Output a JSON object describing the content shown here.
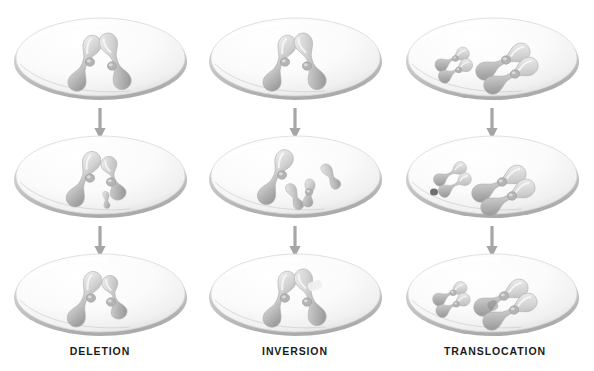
{
  "figure": {
    "background_color": "#ffffff",
    "width": 594,
    "height": 371,
    "rows": 3,
    "columns": 3
  },
  "palette": {
    "cell_fill_light": "#fdfdfd",
    "cell_fill_mid": "#f2f2f2",
    "cell_rim_shadow": "#b9b9b9",
    "cell_outline": "#cfcfcf",
    "chromosome_light": "#e9e9e9",
    "chromosome_mid": "#c9c9c9",
    "chromosome_dark": "#9a9a9a",
    "centromere": "#a8a8a8",
    "fragment_dark": "#6f6f6f",
    "arrow": "#a6a6a6",
    "caption_text": "#1b1b1b"
  },
  "columns": [
    {
      "id": "deletion",
      "caption": "DELETION",
      "center_x": 100,
      "stages": [
        {
          "row": 1,
          "name": "intact-chromosome",
          "description": "Normal duplicated chromosome with two sister chromatids crossed in an X shape inside the cell"
        },
        {
          "row": 2,
          "name": "fragment-broken-off",
          "description": "A small terminal segment has broken away from one chromatid and lies free below the centromere"
        },
        {
          "row": 3,
          "name": "shortened-chromosome",
          "description": "Chromosome reseals without the lost fragment, resulting in a shortened arm"
        }
      ]
    },
    {
      "id": "inversion",
      "caption": "INVERSION",
      "center_x": 295,
      "stages": [
        {
          "row": 1,
          "name": "intact-chromosome",
          "description": "Normal duplicated chromosome with two sister chromatids crossed in an X shape inside the cell"
        },
        {
          "row": 2,
          "name": "segment-detached",
          "description": "One chromatid breaks in two places releasing an interior segment that will be flipped"
        },
        {
          "row": 3,
          "name": "segment-reinserted-reversed",
          "description": "The segment is reinserted in reverse orientation, restoring length with inverted gene order"
        }
      ]
    },
    {
      "id": "translocation",
      "caption": "TRANSLOCATION",
      "center_x": 492,
      "stages": [
        {
          "row": 1,
          "name": "two-chromosome-pairs",
          "description": "Two different chromosomes in one cell: a smaller pair at upper left and a larger X-shaped pair at right"
        },
        {
          "row": 2,
          "name": "segments-exchanged",
          "description": "Both chromosomes break; detached pieces including a small dark fragment lie free in the cell"
        },
        {
          "row": 3,
          "name": "recombined-chromosomes",
          "description": "Each chromosome reforms carrying a segment from the other chromosome"
        }
      ]
    }
  ],
  "arrows": [
    {
      "name": "arrow-deletion-1-to-2",
      "column": "deletion",
      "from_row": 1,
      "to_row": 2,
      "direction": "down"
    },
    {
      "name": "arrow-deletion-2-to-3",
      "column": "deletion",
      "from_row": 2,
      "to_row": 3,
      "direction": "down"
    },
    {
      "name": "arrow-inversion-1-to-2",
      "column": "inversion",
      "from_row": 1,
      "to_row": 2,
      "direction": "down"
    },
    {
      "name": "arrow-inversion-2-to-3",
      "column": "inversion",
      "from_row": 2,
      "to_row": 3,
      "direction": "down"
    },
    {
      "name": "arrow-translocation-1-to-2",
      "column": "translocation",
      "from_row": 1,
      "to_row": 2,
      "direction": "down"
    },
    {
      "name": "arrow-translocation-2-to-3",
      "column": "translocation",
      "from_row": 2,
      "to_row": 3,
      "direction": "down"
    }
  ]
}
